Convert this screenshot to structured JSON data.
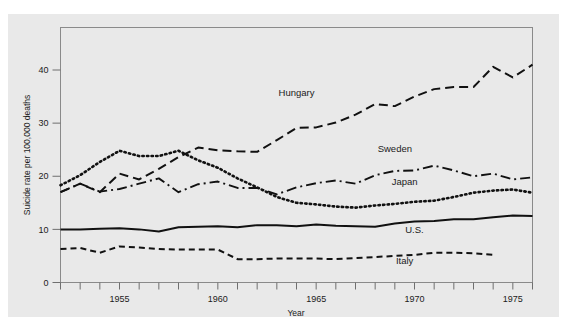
{
  "chart_data": {
    "type": "line",
    "title": "",
    "xlabel": "Year",
    "ylabel": "Suicide rate per 100,000 deaths",
    "xlim": [
      1952,
      1976
    ],
    "ylim": [
      0,
      48
    ],
    "y_ticks": [
      0,
      10,
      20,
      30,
      40
    ],
    "y_tick_labels": [
      "0",
      "10",
      "20",
      "30",
      "40"
    ],
    "x_ticks": [
      1952,
      1953,
      1954,
      1955,
      1956,
      1957,
      1958,
      1959,
      1960,
      1961,
      1962,
      1963,
      1964,
      1965,
      1966,
      1967,
      1968,
      1969,
      1970,
      1971,
      1972,
      1973,
      1974,
      1975,
      1976
    ],
    "x_tick_labels": [
      "1955",
      "1960",
      "1965",
      "1970",
      "1975"
    ],
    "x_labeled_ticks": [
      1955,
      1960,
      1965,
      1970,
      1975
    ],
    "grid": false,
    "legend": "inline-series-labels",
    "line_color": "#111111",
    "plate_color": "#e9e9e9",
    "series": [
      {
        "name": "Hungary",
        "style": "long-dash",
        "dasharray": "9,5",
        "width": 2.0,
        "label_x": 1964.0,
        "label_y": 35.2,
        "x": [
          1952,
          1953,
          1954,
          1955,
          1956,
          1957,
          1958,
          1959,
          1960,
          1961,
          1962,
          1963,
          1964,
          1965,
          1966,
          1967,
          1968,
          1969,
          1970,
          1971,
          1972,
          1973,
          1974,
          1975,
          1976
        ],
        "values": [
          17.0,
          18.6,
          17.0,
          20.5,
          19.4,
          21.4,
          23.6,
          25.4,
          24.9,
          24.7,
          24.6,
          26.8,
          29.1,
          29.2,
          30.1,
          31.6,
          33.6,
          33.2,
          35.0,
          36.4,
          36.8,
          36.8,
          40.6,
          38.6,
          41.0
        ]
      },
      {
        "name": "Sweden",
        "style": "dash-dot",
        "dasharray": "10,4,2,4",
        "width": 1.9,
        "label_x": 1969.0,
        "label_y": 24.6,
        "x": [
          1952,
          1953,
          1954,
          1955,
          1956,
          1957,
          1958,
          1959,
          1960,
          1961,
          1962,
          1963,
          1964,
          1965,
          1966,
          1967,
          1968,
          1969,
          1970,
          1971,
          1972,
          1973,
          1974,
          1975,
          1976
        ],
        "values": [
          17.0,
          18.6,
          17.1,
          17.6,
          18.6,
          19.6,
          17.0,
          18.5,
          19.0,
          17.8,
          17.8,
          16.6,
          17.9,
          18.7,
          19.2,
          18.6,
          20.2,
          21.0,
          21.1,
          22.0,
          21.1,
          20.0,
          20.5,
          19.4,
          19.8
        ]
      },
      {
        "name": "Japan",
        "style": "dotted",
        "dasharray": "1.4,3.2",
        "width": 2.6,
        "label_x": 1969.5,
        "label_y": 18.3,
        "x": [
          1952,
          1953,
          1954,
          1955,
          1956,
          1957,
          1958,
          1959,
          1960,
          1961,
          1962,
          1963,
          1964,
          1965,
          1966,
          1967,
          1968,
          1969,
          1970,
          1971,
          1972,
          1973,
          1974,
          1975,
          1976
        ],
        "values": [
          18.3,
          20.2,
          22.7,
          24.8,
          23.8,
          23.8,
          24.8,
          23.0,
          21.6,
          19.6,
          17.9,
          16.1,
          15.0,
          14.7,
          14.3,
          14.1,
          14.5,
          14.8,
          15.2,
          15.4,
          16.1,
          16.9,
          17.3,
          17.5,
          16.9
        ]
      },
      {
        "name": "U.S.",
        "style": "solid",
        "dasharray": "none",
        "width": 2.0,
        "label_x": 1970.0,
        "label_y": 9.4,
        "x": [
          1952,
          1953,
          1954,
          1955,
          1956,
          1957,
          1958,
          1959,
          1960,
          1961,
          1962,
          1963,
          1964,
          1965,
          1966,
          1967,
          1968,
          1969,
          1970,
          1971,
          1972,
          1973,
          1974,
          1975,
          1976
        ],
        "values": [
          10.0,
          10.0,
          10.1,
          10.2,
          10.0,
          9.6,
          10.4,
          10.5,
          10.6,
          10.4,
          10.8,
          10.8,
          10.6,
          10.9,
          10.7,
          10.6,
          10.5,
          11.1,
          11.5,
          11.6,
          11.9,
          11.9,
          12.3,
          12.6,
          12.5
        ]
      },
      {
        "name": "Italy",
        "style": "short-dash",
        "dasharray": "6,4",
        "width": 2.0,
        "label_x": 1969.5,
        "label_y": 3.5,
        "x": [
          1952,
          1953,
          1954,
          1955,
          1956,
          1957,
          1958,
          1959,
          1960,
          1961,
          1962,
          1963,
          1964,
          1965,
          1966,
          1967,
          1968,
          1969,
          1970,
          1971,
          1972,
          1973,
          1974
        ],
        "values": [
          6.3,
          6.5,
          5.6,
          6.8,
          6.6,
          6.3,
          6.2,
          6.2,
          6.2,
          4.4,
          4.4,
          4.5,
          4.5,
          4.5,
          4.4,
          4.6,
          4.8,
          5.0,
          5.2,
          5.6,
          5.6,
          5.5,
          5.2
        ]
      }
    ]
  },
  "axes": {
    "x_title": "Year",
    "y_title": "Suicide rate per 100,000 deaths"
  }
}
